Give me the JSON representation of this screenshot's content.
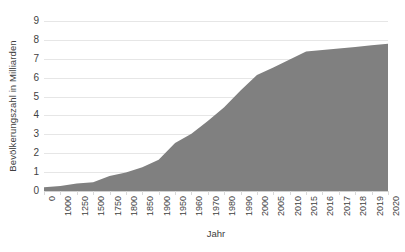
{
  "chart_data": {
    "type": "area",
    "title": "",
    "subtitle": "",
    "xlabel": "Jahr",
    "ylabel": "Bevölkerungszahl in Milliarden",
    "categories": [
      "0",
      "1000",
      "1250",
      "1500",
      "1750",
      "1800",
      "1850",
      "1900",
      "1950",
      "1960",
      "1970",
      "1980",
      "1990",
      "2000",
      "2005",
      "2010",
      "2015",
      "2016",
      "2017",
      "2018",
      "2019",
      "2020"
    ],
    "values": [
      0.2,
      0.27,
      0.4,
      0.46,
      0.79,
      0.98,
      1.26,
      1.65,
      2.54,
      3.03,
      3.7,
      4.44,
      5.32,
      6.14,
      6.54,
      6.96,
      7.38,
      7.46,
      7.55,
      7.63,
      7.71,
      7.79
    ],
    "series": [
      {
        "name": "Weltbevölkerung",
        "values": [
          0.2,
          0.27,
          0.4,
          0.46,
          0.79,
          0.98,
          1.26,
          1.65,
          2.54,
          3.03,
          3.7,
          4.44,
          5.32,
          6.14,
          6.54,
          6.96,
          7.38,
          7.46,
          7.55,
          7.63,
          7.71,
          7.79
        ]
      }
    ],
    "ytick_labels": [
      "0",
      "1",
      "2",
      "3",
      "4",
      "5",
      "6",
      "7",
      "8",
      "9"
    ],
    "ytick_values": [
      0,
      1,
      2,
      3,
      4,
      5,
      6,
      7,
      8,
      9
    ],
    "ylim": [
      0,
      9
    ],
    "xlim_index": [
      0,
      21
    ],
    "grid": true,
    "grid_axis": "y",
    "legend": false,
    "legend_position": "none",
    "annotations": [],
    "colors": {
      "area_fill": "#808080",
      "gridline": "#e6e6e6",
      "axis_line": "#d0d0d0",
      "tick_mark": "#d9d9d9",
      "text": "#404040",
      "background": "#ffffff"
    },
    "axis_label_rotation_x": 90,
    "axis_label_rotation_y": 90
  }
}
